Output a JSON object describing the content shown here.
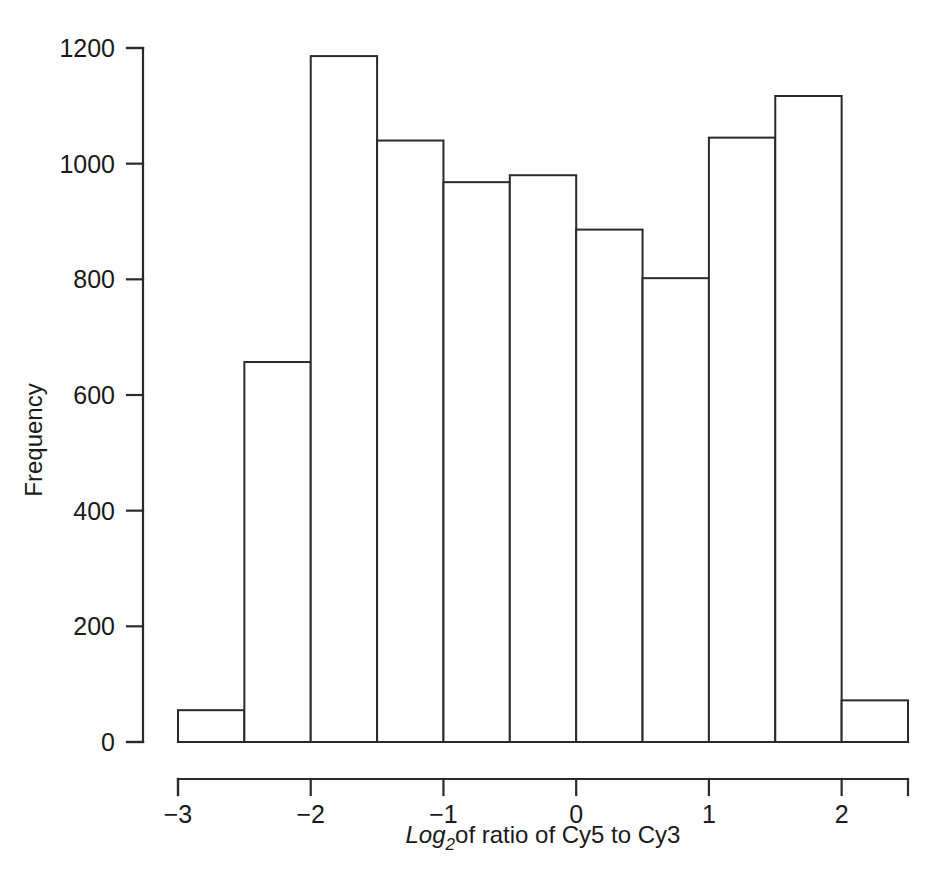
{
  "chart_data": {
    "type": "bar",
    "title": "",
    "xlabel": "Log2of ratio of Cy5 to Cy3",
    "xlabel_parts": {
      "italic_main": "Log",
      "subscript": "2",
      "rest": "of ratio of Cy5 to Cy3"
    },
    "ylabel": "Frequency",
    "xlim": [
      -3.25,
      2.6
    ],
    "ylim": [
      0,
      1240
    ],
    "grid": false,
    "legend": null,
    "bin_width": 0.5,
    "bin_edges": [
      -3.0,
      -2.5,
      -2.0,
      -1.5,
      -1.0,
      -0.5,
      0.0,
      0.5,
      1.0,
      1.5,
      2.0,
      2.5
    ],
    "categories": [
      "-3.0 to -2.5",
      "-2.5 to -2.0",
      "-2.0 to -1.5",
      "-1.5 to -1.0",
      "-1.0 to -0.5",
      "-0.5 to 0.0",
      "0.0 to 0.5",
      "0.5 to 1.0",
      "1.0 to 1.5",
      "1.5 to 2.0",
      "2.0 to 2.5"
    ],
    "values": [
      55,
      657,
      1186,
      1040,
      968,
      980,
      886,
      802,
      1045,
      1117,
      72
    ],
    "x_ticks": [
      -3,
      -2,
      -1,
      0,
      1,
      2
    ],
    "x_tick_labels": [
      "−3",
      "−2",
      "−1",
      "0",
      "1",
      "2"
    ],
    "y_ticks": [
      0,
      200,
      400,
      600,
      800,
      1000,
      1200
    ],
    "y_tick_labels": [
      "0",
      "200",
      "400",
      "600",
      "800",
      "1000",
      "1200"
    ],
    "bar_fill_color": "#ffffff",
    "bar_stroke_color": "#2a2a2a",
    "background_color": "#fefefe"
  }
}
